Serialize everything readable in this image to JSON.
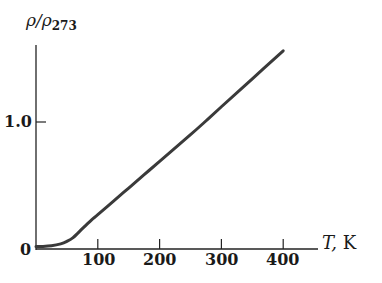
{
  "chart_data": {
    "type": "line",
    "title": "",
    "xlabel": "T, K",
    "ylabel": "ρ/ρ273",
    "ylabel_parts": {
      "main": "ρ/ρ",
      "subscript": "273"
    },
    "xlabel_parts": {
      "var": "T,",
      "unit": "K"
    },
    "xlim": [
      0,
      420
    ],
    "ylim": [
      0,
      1.65
    ],
    "x_ticks": [
      100,
      200,
      300,
      400
    ],
    "x_tick_labels": [
      "100",
      "200",
      "300",
      "400"
    ],
    "y_ticks": [
      0,
      1.0
    ],
    "y_tick_labels": [
      "0",
      "1.0"
    ],
    "grid": false,
    "legend": null,
    "series": [
      {
        "name": "resistivity ratio",
        "color": "#3a3a3a",
        "x": [
          0,
          10,
          25,
          40,
          50,
          60,
          75,
          90,
          100,
          125,
          150,
          175,
          200,
          250,
          273,
          300,
          350,
          400
        ],
        "values": [
          0.02,
          0.02,
          0.025,
          0.04,
          0.06,
          0.09,
          0.16,
          0.23,
          0.27,
          0.375,
          0.48,
          0.585,
          0.69,
          0.9,
          1.0,
          1.12,
          1.34,
          1.56
        ]
      }
    ]
  }
}
